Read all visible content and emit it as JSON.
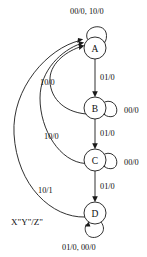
{
  "diagram": {
    "type": "state-transition-diagram",
    "notation_caption": "X\"Y\"/Z\"",
    "states": [
      {
        "id": "A",
        "label": "A",
        "cx": 95,
        "cy": 48,
        "r": 11
      },
      {
        "id": "B",
        "label": "B",
        "cx": 95,
        "cy": 108,
        "r": 11
      },
      {
        "id": "C",
        "label": "C",
        "cx": 95,
        "cy": 160,
        "r": 11
      },
      {
        "id": "D",
        "label": "D",
        "cx": 95,
        "cy": 213,
        "r": 11
      }
    ],
    "transitions": [
      {
        "from": "A",
        "to": "A",
        "label": "00/0, 10/0",
        "kind": "self-loop-top"
      },
      {
        "from": "A",
        "to": "B",
        "label": "01/0",
        "kind": "straight-down"
      },
      {
        "from": "B",
        "to": "B",
        "label": "00/0",
        "kind": "self-loop-right"
      },
      {
        "from": "B",
        "to": "C",
        "label": "01/0",
        "kind": "straight-down"
      },
      {
        "from": "C",
        "to": "C",
        "label": "00/0",
        "kind": "self-loop-right"
      },
      {
        "from": "C",
        "to": "D",
        "label": "01/0",
        "kind": "straight-down"
      },
      {
        "from": "D",
        "to": "D",
        "label": "01/0, 00/0",
        "kind": "self-loop-bottom"
      },
      {
        "from": "B",
        "to": "A",
        "label": "10/0",
        "kind": "curved-return-left"
      },
      {
        "from": "C",
        "to": "A",
        "label": "10/0",
        "kind": "curved-return-left"
      },
      {
        "from": "D",
        "to": "A",
        "label": "10/1",
        "kind": "curved-return-left"
      }
    ],
    "labels": {
      "top_self_loop_a": "00/0, 10/0",
      "a_to_b": "01/0",
      "b_self_loop": "00/0",
      "b_to_c": "01/0",
      "c_self_loop": "00/0",
      "c_to_d": "01/0",
      "d_self_loop": "01/0, 00/0",
      "b_to_a": "10/0",
      "c_to_a": "10/0",
      "d_to_a": "10/1",
      "caption": "X\"Y\"/Z\""
    },
    "colors": {
      "stroke": "#1a1a1a",
      "text": "#0d0d0d",
      "background": "#ffffff"
    }
  }
}
